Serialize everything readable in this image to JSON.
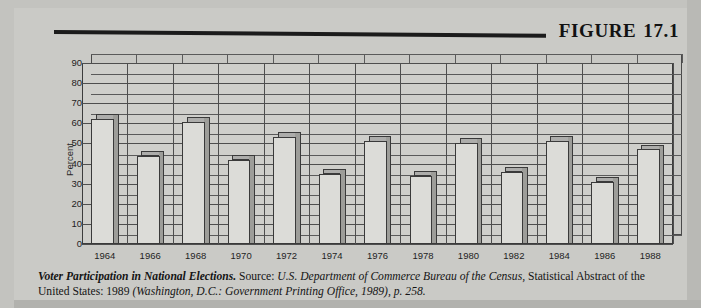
{
  "figure": {
    "label": "FIGURE",
    "number": "17.1"
  },
  "chart_data": {
    "type": "bar",
    "title": "Voter Participation in National Elections",
    "xlabel": "",
    "ylabel": "Percent",
    "ylim": [
      0,
      90
    ],
    "ytick_step": 10,
    "yticks": [
      "90",
      "80",
      "70",
      "60",
      "50",
      "40",
      "30",
      "20",
      "10",
      "0"
    ],
    "grid": true,
    "legend": "none",
    "categories": [
      "1964",
      "1966",
      "1968",
      "1970",
      "1972",
      "1974",
      "1976",
      "1978",
      "1980",
      "1982",
      "1984",
      "1986",
      "1988"
    ],
    "values": [
      62,
      44,
      60.5,
      42,
      53,
      35,
      51,
      34,
      50,
      36,
      51,
      31,
      47
    ]
  },
  "caption": {
    "lead": "Voter Participation in National Elections.",
    "source_label": "Source:",
    "source_italic_1": "U.S. Department of Commerce Bureau of the Census,",
    "source_roman_1": "Statistical Abstract of the United States: 1989",
    "source_italic_2": "(Washington, D.C.: Government Printing Office, 1989), p. 258."
  }
}
